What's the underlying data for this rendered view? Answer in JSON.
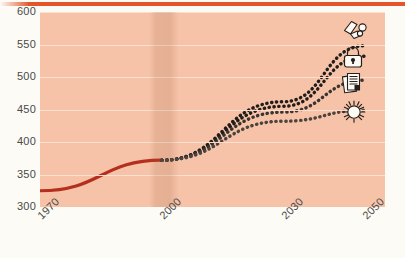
{
  "figure": {
    "background_color": "#fdfbf6",
    "plot_background_color": "#f7c3a8",
    "accent_bar_color": "#e2562a",
    "historical_color": "#b52f1e",
    "projection_color": "#211d1a"
  },
  "axes": {
    "y_ticks": [
      "600",
      "550",
      "500",
      "450",
      "400",
      "350",
      "300"
    ],
    "x_ticks": [
      "1970",
      "2000",
      "2030",
      "2050"
    ]
  },
  "icons": [
    {
      "name": "coal-fuel-icon",
      "label": "coal / fossil fuel"
    },
    {
      "name": "padlock-icon",
      "label": "padlock"
    },
    {
      "name": "documents-icon",
      "label": "documents"
    },
    {
      "name": "sun-icon",
      "label": "sun / renewable"
    }
  ],
  "chart_data": {
    "type": "line",
    "title": "",
    "xlabel": "",
    "ylabel": "",
    "xlim": [
      1970,
      2055
    ],
    "ylim": [
      300,
      600
    ],
    "y_ticks": [
      300,
      350,
      400,
      450,
      500,
      550,
      600
    ],
    "x_ticks": [
      1970,
      2000,
      2030,
      2050
    ],
    "grid": true,
    "legend": "none",
    "projection_start_year": 2000,
    "series": [
      {
        "name": "historical",
        "style": "solid",
        "color": "#b52f1e",
        "x": [
          1970,
          2000
        ],
        "values": [
          325,
          372
        ]
      },
      {
        "name": "scenario-1",
        "style": "dotted",
        "color": "#211d1a",
        "x": [
          2000,
          2030,
          2050
        ],
        "values": [
          372,
          462,
          548
        ]
      },
      {
        "name": "scenario-2",
        "style": "dotted",
        "color": "#211d1a",
        "x": [
          2000,
          2030,
          2050
        ],
        "values": [
          372,
          455,
          532
        ]
      },
      {
        "name": "scenario-3",
        "style": "dotted",
        "color": "#3a3430",
        "x": [
          2000,
          2030,
          2050
        ],
        "values": [
          372,
          446,
          495
        ]
      },
      {
        "name": "scenario-4",
        "style": "dotted",
        "color": "#4a433e",
        "x": [
          2000,
          2030,
          2050
        ],
        "values": [
          372,
          432,
          449
        ]
      }
    ]
  }
}
